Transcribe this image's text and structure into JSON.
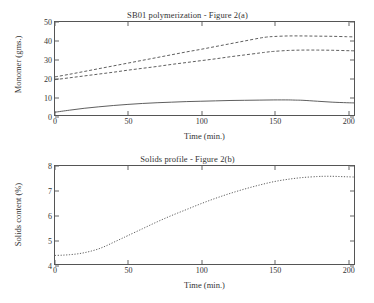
{
  "chart_data": [
    {
      "id": "figure-2a",
      "type": "line",
      "title": "SB01 polymerization - Figure 2(a)",
      "xlabel": "Time (min.)",
      "ylabel": "Monomer (gms.)",
      "xlim": [
        0,
        205
      ],
      "ylim": [
        0,
        50
      ],
      "xticks": [
        0,
        50,
        100,
        150,
        200
      ],
      "yticks": [
        0,
        10,
        20,
        30,
        40,
        50
      ],
      "grid": false,
      "legend": "none",
      "series": [
        {
          "name": "monomer-upper-dashed",
          "style": "dashed",
          "x": [
            0,
            10,
            20,
            30,
            40,
            50,
            60,
            70,
            80,
            90,
            100,
            110,
            120,
            130,
            140,
            145,
            150,
            160,
            170,
            180,
            190,
            200,
            205
          ],
          "values": [
            20.5,
            21.9,
            23.4,
            24.9,
            26.4,
            27.9,
            29.4,
            30.9,
            32.4,
            33.9,
            35.3,
            36.8,
            38.3,
            39.8,
            41.3,
            41.9,
            42.2,
            42.5,
            42.5,
            42.4,
            42.3,
            42.1,
            42.0
          ]
        },
        {
          "name": "monomer-lower-dashed",
          "style": "dashed",
          "x": [
            0,
            10,
            20,
            30,
            40,
            50,
            60,
            70,
            80,
            90,
            100,
            110,
            120,
            130,
            140,
            145,
            150,
            160,
            170,
            180,
            190,
            200,
            205
          ],
          "values": [
            19.0,
            20.0,
            21.0,
            22.0,
            23.0,
            24.1,
            25.1,
            26.1,
            27.2,
            28.2,
            29.2,
            30.2,
            31.3,
            32.3,
            33.3,
            33.8,
            34.2,
            34.7,
            34.9,
            34.9,
            34.8,
            34.6,
            34.5
          ]
        },
        {
          "name": "monomer-solid",
          "style": "solid",
          "x": [
            0,
            10,
            20,
            30,
            40,
            50,
            60,
            70,
            80,
            90,
            100,
            110,
            120,
            130,
            140,
            150,
            160,
            165,
            170,
            180,
            190,
            200,
            205
          ],
          "values": [
            1.5,
            2.6,
            3.6,
            4.4,
            5.1,
            5.7,
            6.2,
            6.6,
            6.9,
            7.2,
            7.4,
            7.6,
            7.8,
            7.9,
            8.0,
            8.1,
            8.1,
            8.0,
            7.9,
            7.4,
            6.9,
            6.6,
            6.5
          ]
        }
      ]
    },
    {
      "id": "figure-2b",
      "type": "line",
      "title": "Solids profile - Figure 2(b)",
      "xlabel": "Time (min.)",
      "ylabel": "Solids content (%)",
      "xlim": [
        0,
        205
      ],
      "ylim": [
        4,
        8
      ],
      "xticks": [
        0,
        50,
        100,
        150,
        200
      ],
      "yticks": [
        4,
        5,
        6,
        7,
        8
      ],
      "grid": false,
      "legend": "none",
      "series": [
        {
          "name": "solids-content",
          "style": "dotted",
          "x": [
            0,
            5,
            10,
            15,
            20,
            25,
            30,
            35,
            40,
            45,
            50,
            60,
            70,
            80,
            90,
            100,
            110,
            120,
            130,
            140,
            150,
            160,
            170,
            180,
            185,
            190,
            195,
            200,
            205
          ],
          "values": [
            4.35,
            4.36,
            4.38,
            4.41,
            4.46,
            4.53,
            4.62,
            4.74,
            4.88,
            5.02,
            5.16,
            5.44,
            5.72,
            5.98,
            6.22,
            6.46,
            6.68,
            6.88,
            7.06,
            7.22,
            7.36,
            7.46,
            7.53,
            7.57,
            7.58,
            7.58,
            7.57,
            7.56,
            7.55
          ]
        }
      ]
    }
  ],
  "figures": {
    "a": {
      "title": "SB01 polymerization - Figure 2(a)",
      "xlabel": "Time (min.)",
      "ylabel": "Monomer (gms.)",
      "xticks": [
        "0",
        "50",
        "100",
        "150",
        "200"
      ],
      "yticks": [
        "0",
        "10",
        "20",
        "30",
        "40",
        "50"
      ]
    },
    "b": {
      "title": "Solids profile - Figure 2(b)",
      "xlabel": "Time (min.)",
      "ylabel": "Solids content (%)",
      "xticks": [
        "0",
        "50",
        "100",
        "150",
        "200"
      ],
      "yticks": [
        "4",
        "5",
        "6",
        "7",
        "8"
      ]
    }
  },
  "colors": {
    "axis": "#555555",
    "series": "#4a4a4a",
    "background": "#ffffff"
  }
}
